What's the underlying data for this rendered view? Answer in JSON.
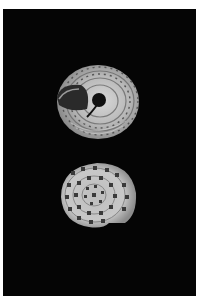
{
  "image": {
    "description": "Photograph of two views of a small spotted snail shell on a black background",
    "background_color": "#050505",
    "border_color": "#ffffff",
    "specimens": [
      {
        "view": "umbilical",
        "position": "top"
      },
      {
        "view": "apical",
        "position": "bottom"
      }
    ]
  }
}
